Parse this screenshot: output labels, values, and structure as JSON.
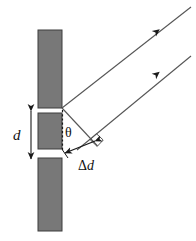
{
  "figure": {
    "type": "physics-diagram",
    "canvas": {
      "width": 196,
      "height": 241
    },
    "background_color": "#ffffff",
    "line_color": "#4d4d4d",
    "label_color": "#111111"
  },
  "barriers": {
    "fill_color": "#787878",
    "stroke_color": "#3d3d3d",
    "items": [
      {
        "name": "top-barrier",
        "x": 38,
        "y": 30,
        "width": 24,
        "height": 78
      },
      {
        "name": "middle-barrier",
        "x": 38,
        "y": 113,
        "width": 24,
        "height": 36
      },
      {
        "name": "bottom-barrier",
        "x": 38,
        "y": 158,
        "width": 24,
        "height": 73
      }
    ]
  },
  "slits": [
    {
      "name": "upper-slit",
      "y": 108,
      "height": 5
    },
    {
      "name": "lower-slit",
      "y": 149,
      "height": 9
    }
  ],
  "rays": [
    {
      "name": "upper-ray",
      "from": [
        62,
        108
      ],
      "to": [
        191,
        7
      ],
      "arrow_at": [
        154,
        33
      ]
    },
    {
      "name": "lower-ray",
      "from": [
        77,
        149
      ],
      "to": [
        191,
        56
      ],
      "arrow_at": [
        154,
        77
      ]
    }
  ],
  "wavefront": {
    "name": "wavefront-line",
    "from": [
      62,
      108
    ],
    "to": [
      96,
      145
    ]
  },
  "path_difference": {
    "name": "delta-d-segment",
    "from": [
      96,
      145
    ],
    "to": [
      66,
      157
    ]
  },
  "labels": {
    "slit_spacing": "d",
    "angle": "θ",
    "path_difference_delta": "Δ",
    "path_difference_d": "d"
  },
  "dimension_arrow": {
    "name": "slit-spacing-arrow",
    "x": 31,
    "y_top": 107,
    "y_bottom": 163,
    "label_x": 14,
    "label_y": 139
  },
  "angle_marker": {
    "name": "theta-angle",
    "vertex": [
      62,
      110
    ],
    "label_x": 66,
    "label_y": 133
  },
  "right_angle_marker": {
    "name": "right-angle-square",
    "corner": [
      96,
      145
    ]
  },
  "dashed_line": {
    "name": "vertical-dashed-reference",
    "x": 62,
    "y_top": 110,
    "y_bottom": 150
  },
  "delta_d_label": {
    "x": 75,
    "y": 168
  }
}
